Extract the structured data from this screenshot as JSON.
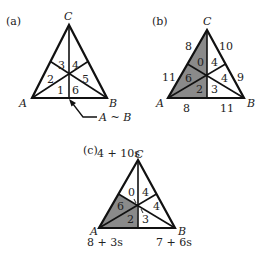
{
  "panels": [
    {
      "id": "a",
      "label": "(a)",
      "vertices": {
        "A": "A",
        "B": "B",
        "C": "C"
      },
      "regions": [
        "1",
        "2",
        "3",
        "4",
        "5",
        "6"
      ],
      "annotation": "A ~ B"
    },
    {
      "id": "b",
      "label": "(b)",
      "vertices": {
        "A": "A",
        "B": "B",
        "C": "C"
      },
      "regions": [
        "2",
        "6",
        "0",
        "4",
        "4",
        "3"
      ],
      "edge_labels": {
        "CA_upper": "8",
        "CA_lower": "11",
        "CB_upper": "10",
        "CB_lower": "9",
        "AB_left": "8",
        "AB_right": "11"
      },
      "shaded_regions": [
        "2",
        "6",
        "0"
      ]
    },
    {
      "id": "c",
      "label": "(c)",
      "vertices": {
        "A": "A",
        "B": "B",
        "C": "C"
      },
      "regions": [
        "2",
        "6",
        "0",
        "4",
        "4",
        "3"
      ],
      "vertex_labels": {
        "C": "4 + 10s",
        "A": "8 + 3s",
        "B": "7 + 6s"
      },
      "shaded_regions": [
        "2",
        "6"
      ]
    }
  ],
  "colors": {
    "shade": "#8a8a8a",
    "line": "#111111",
    "background": "#ffffff"
  }
}
